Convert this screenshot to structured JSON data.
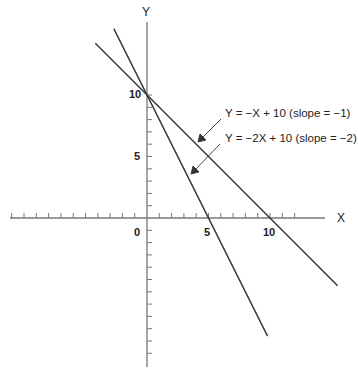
{
  "chart_data": {
    "type": "line",
    "title": "",
    "xlabel": "X",
    "ylabel": "Y",
    "x_ticks_labeled": [
      0,
      5,
      10
    ],
    "y_ticks_labeled": [
      5,
      10
    ],
    "origin_label": "0",
    "xlim": [
      -11,
      13
    ],
    "ylim": [
      -12,
      16
    ],
    "grid": false,
    "series": [
      {
        "name": "Y = −X + 10 (slope = −1)",
        "slope": -1,
        "intercept": 10,
        "x": [
          -4.2,
          15.5
        ],
        "y": [
          14.2,
          -5.5
        ]
      },
      {
        "name": "Y = −2X + 10 (slope = −2)",
        "slope": -2,
        "intercept": 10,
        "x": [
          -2.7,
          9.8
        ],
        "y": [
          15.4,
          -9.6
        ]
      }
    ],
    "annotations": [
      {
        "text": "Y = −X + 10 (slope = −1)",
        "points_to": "line slope -1"
      },
      {
        "text": "Y = −2X + 10 (slope = −2)",
        "points_to": "line slope -2"
      }
    ],
    "colors": {
      "axis": "#777777",
      "lines": "#333333"
    }
  },
  "labels": {
    "x_axis": "X",
    "y_axis": "Y",
    "origin": "0",
    "x5": "5",
    "x10": "10",
    "y5": "5",
    "y10": "10",
    "eq1": "Y = −X + 10 (slope = −1)",
    "eq2": "Y = −2X + 10 (slope = −2)"
  }
}
